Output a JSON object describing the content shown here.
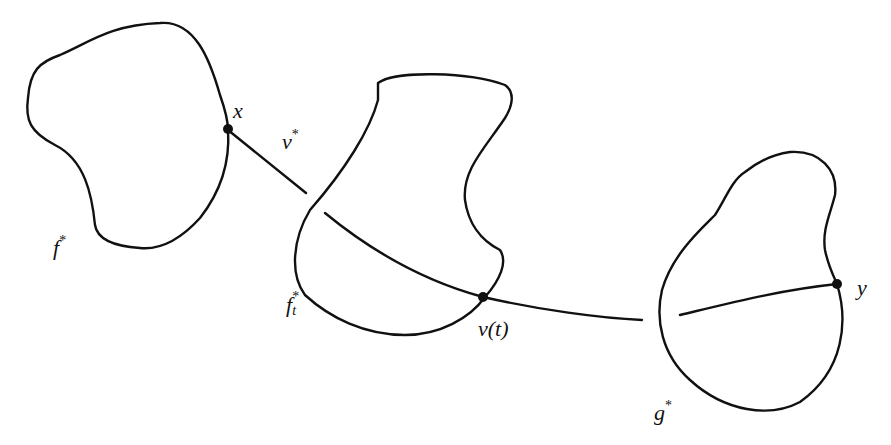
{
  "diagram": {
    "type": "path-between-regions",
    "regions": [
      {
        "id": "f-star",
        "label": "f",
        "superscript": "*",
        "subscript": ""
      },
      {
        "id": "f-t-star",
        "label": "f",
        "superscript": "*",
        "subscript": "t"
      },
      {
        "id": "g-star",
        "label": "g",
        "superscript": "*",
        "subscript": ""
      }
    ],
    "points": [
      {
        "id": "x",
        "label": "x"
      },
      {
        "id": "nu-t",
        "label": "ν(t)"
      },
      {
        "id": "y",
        "label": "y"
      }
    ],
    "path": {
      "label": "ν",
      "superscript": "*"
    }
  },
  "labels": {
    "f_star": "f",
    "f_star_sup": "*",
    "ft_star": "f",
    "ft_star_sup": "*",
    "ft_star_sub": "t",
    "g_star": "g",
    "g_star_sup": "*",
    "x": "x",
    "y": "y",
    "nu_star": "ν",
    "nu_star_sup": "*",
    "nu_t": "ν(t)"
  },
  "colors": {
    "stroke": "#111111",
    "background": "#ffffff"
  }
}
